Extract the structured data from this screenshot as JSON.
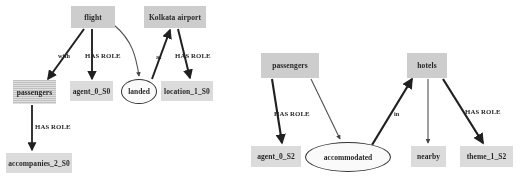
{
  "figure": {
    "type": "two-panel-semantic-graph",
    "panels": [
      {
        "id": "left",
        "nodes": [
          {
            "id": "flight",
            "label": "flight",
            "shape": "rect",
            "style": "gray",
            "x": 71,
            "y": 6,
            "w": 44,
            "h": 22
          },
          {
            "id": "kolkata",
            "label": "Kolkata airport",
            "shape": "rect",
            "style": "gray",
            "x": 144,
            "y": 6,
            "w": 62,
            "h": 22
          },
          {
            "id": "passengers",
            "label": "passengers",
            "shape": "rect",
            "style": "hatch",
            "x": 13,
            "y": 80,
            "w": 43,
            "h": 24
          },
          {
            "id": "agent_0_S0",
            "label": "agent_0_S0",
            "shape": "rect",
            "style": "light",
            "x": 70,
            "y": 81,
            "w": 43,
            "h": 20
          },
          {
            "id": "landed",
            "label": "landed",
            "shape": "ellipse",
            "style": "white",
            "x": 121,
            "y": 79,
            "w": 36,
            "h": 25
          },
          {
            "id": "location_1_S0",
            "label": "location_1_S0",
            "shape": "rect",
            "style": "light",
            "x": 161,
            "y": 81,
            "w": 52,
            "h": 20
          },
          {
            "id": "accompanies",
            "label": "accompanies_2_S0",
            "shape": "rect",
            "style": "light",
            "x": 6,
            "y": 153,
            "w": 66,
            "h": 20
          }
        ],
        "edges": [
          {
            "from": "flight",
            "to": "passengers",
            "label": "with",
            "label_x": 58,
            "label_y": 52
          },
          {
            "from": "flight",
            "to": "agent_0_S0",
            "label": "HAS ROLE",
            "label_x": 85,
            "label_y": 52
          },
          {
            "from": "flight",
            "to": "landed",
            "label": "",
            "label_x": 0,
            "label_y": 0
          },
          {
            "from": "landed",
            "to": "kolkata",
            "label": "at",
            "label_x": 156,
            "label_y": 53
          },
          {
            "from": "kolkata",
            "to": "location_1_S0",
            "label": "HAS ROLE",
            "label_x": 175,
            "label_y": 52
          },
          {
            "from": "passengers",
            "to": "accompanies",
            "label": "HAS ROLE",
            "label_x": 35,
            "label_y": 123
          }
        ]
      },
      {
        "id": "right",
        "nodes": [
          {
            "id": "passengers2",
            "label": "passengers",
            "shape": "rect",
            "style": "gray",
            "x": 261,
            "y": 53,
            "w": 58,
            "h": 25
          },
          {
            "id": "hotels",
            "label": "hotels",
            "shape": "rect",
            "style": "gray",
            "x": 407,
            "y": 53,
            "w": 40,
            "h": 25
          },
          {
            "id": "agent_0_S2",
            "label": "agent_0_S2",
            "shape": "rect",
            "style": "light",
            "x": 251,
            "y": 146,
            "w": 50,
            "h": 21
          },
          {
            "id": "accommodated",
            "label": "accommodated",
            "shape": "ellipse",
            "style": "white",
            "x": 305,
            "y": 142,
            "w": 86,
            "h": 30
          },
          {
            "id": "nearby",
            "label": "nearby",
            "shape": "rect",
            "style": "light",
            "x": 411,
            "y": 146,
            "w": 35,
            "h": 21
          },
          {
            "id": "theme_1_S2",
            "label": "theme_1_S2",
            "shape": "rect",
            "style": "light",
            "x": 460,
            "y": 146,
            "w": 53,
            "h": 21
          }
        ],
        "edges": [
          {
            "from": "passengers2",
            "to": "agent_0_S2",
            "label": "HAS ROLE",
            "label_x": 274,
            "label_y": 110
          },
          {
            "from": "passengers2",
            "to": "accommodated",
            "label": "",
            "label_x": 0,
            "label_y": 0
          },
          {
            "from": "accommodated",
            "to": "hotels",
            "label": "in",
            "label_x": 394,
            "label_y": 110
          },
          {
            "from": "hotels",
            "to": "nearby",
            "label": "",
            "label_x": 0,
            "label_y": 0
          },
          {
            "from": "hotels",
            "to": "theme_1_S2",
            "label": "HAS ROLE",
            "label_x": 465,
            "label_y": 108
          }
        ]
      }
    ]
  },
  "colors": {
    "node_gray": "#cfcfcf",
    "node_light": "#dedede",
    "node_hatch": "#c2c2c2",
    "stroke": "#1a1a1a",
    "background": "#ffffff"
  }
}
